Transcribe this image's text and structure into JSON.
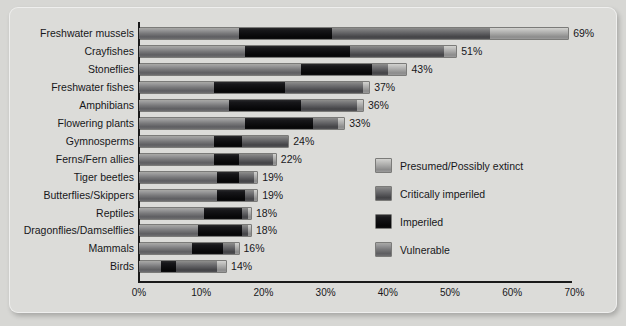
{
  "chart_data": {
    "type": "bar",
    "orientation": "horizontal",
    "stacked": true,
    "title": "",
    "xlabel": "",
    "ylabel": "",
    "xlim": [
      0,
      75
    ],
    "xticks": [
      "0%",
      "10%",
      "20%",
      "30%",
      "40%",
      "50%",
      "60%",
      "70%"
    ],
    "xtick_values": [
      0,
      10,
      20,
      30,
      40,
      50,
      60,
      70
    ],
    "grid": false,
    "legend_position": "inside-right",
    "categories": [
      "Freshwater mussels",
      "Crayfishes",
      "Stoneflies",
      "Freshwater fishes",
      "Amphibians",
      "Flowering plants",
      "Gymnosperms",
      "Ferns/Fern allies",
      "Tiger beetles",
      "Butterflies/Skippers",
      "Reptiles",
      "Dragonflies/Damselflies",
      "Mammals",
      "Birds"
    ],
    "series": [
      {
        "name": "Vulnerable",
        "key": "vulnerable",
        "color": "#78787a",
        "values": [
          16.0,
          17.0,
          26.0,
          12.0,
          14.5,
          17.0,
          12.0,
          12.0,
          12.5,
          12.5,
          10.5,
          9.5,
          8.5,
          3.5
        ]
      },
      {
        "name": "Imperiled",
        "key": "imperiled",
        "color": "#0d0d0f",
        "values": [
          15.0,
          17.0,
          11.5,
          11.5,
          11.5,
          11.0,
          4.5,
          4.0,
          3.5,
          4.5,
          6.0,
          7.0,
          5.0,
          2.5
        ]
      },
      {
        "name": "Critically imperiled",
        "key": "critically",
        "color": "#5d5d60",
        "values": [
          25.5,
          15.0,
          2.5,
          12.5,
          9.0,
          4.0,
          7.5,
          5.5,
          2.5,
          1.5,
          1.0,
          1.0,
          2.0,
          6.5
        ]
      },
      {
        "name": "Presumed/Possibly extinct",
        "key": "extinct",
        "color": "#a6a6a5",
        "values": [
          12.5,
          2.0,
          3.0,
          1.0,
          1.0,
          1.0,
          0.0,
          0.5,
          0.5,
          0.5,
          0.5,
          0.5,
          0.5,
          1.5
        ]
      }
    ],
    "totals": [
      69,
      51,
      43,
      37,
      36,
      33,
      24,
      22,
      19,
      19,
      18,
      18,
      16,
      14
    ],
    "value_labels": [
      "69%",
      "51%",
      "43%",
      "37%",
      "36%",
      "33%",
      "24%",
      "22%",
      "19%",
      "19%",
      "18%",
      "18%",
      "16%",
      "14%"
    ]
  },
  "legend": {
    "items": [
      {
        "label": "Presumed/Possibly extinct",
        "key": "extinct"
      },
      {
        "label": "Critically imperiled",
        "key": "critically"
      },
      {
        "label": "Imperiled",
        "key": "imperiled"
      },
      {
        "label": "Vulnerable",
        "key": "vulnerable"
      }
    ]
  },
  "colors": {
    "vulnerable": "#78787a",
    "imperiled": "#0d0d0f",
    "critically": "#5d5d60",
    "extinct": "#a6a6a5",
    "axis": "#1a1a1a",
    "background": "#dcdcd9",
    "text": "#17171a"
  }
}
